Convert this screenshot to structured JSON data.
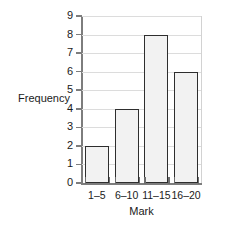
{
  "chart_data": {
    "type": "bar",
    "title": "",
    "categories": [
      "1–5",
      "6–10",
      "11–15",
      "16–20"
    ],
    "values": [
      2,
      4,
      8,
      6
    ],
    "xlabel": "Mark",
    "ylabel": "Frequency",
    "ylim": [
      0,
      9
    ],
    "ytick_labels": [
      "0",
      "1",
      "2",
      "3",
      "4",
      "5",
      "6",
      "7",
      "8",
      "9"
    ],
    "ytick_values": [
      0,
      1,
      2,
      3,
      4,
      5,
      6,
      7,
      8,
      9
    ],
    "grid": "horizontal",
    "legend": "none",
    "colors": {
      "bar_fill": "#f2f2f2",
      "bar_edge": "#2e2e2e",
      "gridline": "#dcdcdc",
      "axis": "#7d7d7d",
      "text": "#1a1a1a",
      "background": "#ffffff"
    }
  }
}
